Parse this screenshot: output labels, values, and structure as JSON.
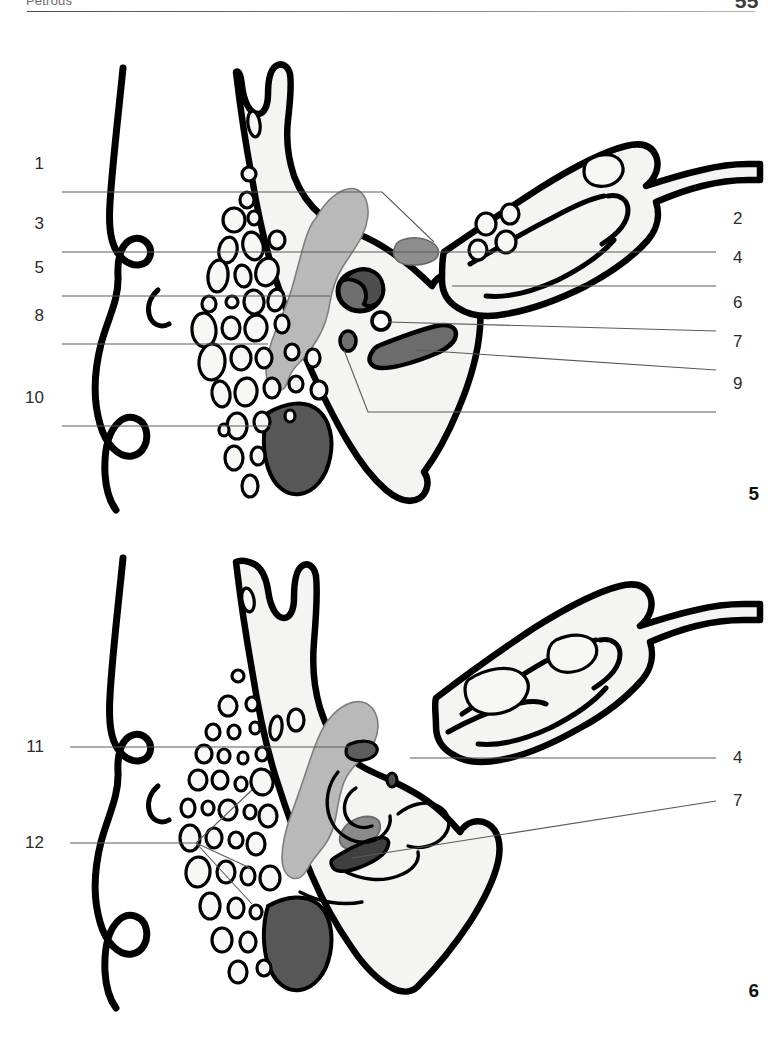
{
  "page": {
    "running_head": "Petrous",
    "folio": "55",
    "width": 781,
    "height": 1050
  },
  "colors": {
    "ink": "#000000",
    "paper": "#ffffff",
    "bone_fill": "#f4f4f2",
    "shade_light": "#b9b9b9",
    "shade_mid": "#8e8e8e",
    "shade_dark": "#585858",
    "leader": "#5a5a5a",
    "label_text": "#2b2b2b"
  },
  "figures": [
    {
      "id": "figure-5",
      "number": "5",
      "callouts_left": [
        {
          "label": "1",
          "x": 44,
          "y": 164
        },
        {
          "label": "3",
          "x": 44,
          "y": 224
        },
        {
          "label": "5",
          "x": 44,
          "y": 268
        },
        {
          "label": "8",
          "x": 44,
          "y": 316
        },
        {
          "label": "10",
          "x": 44,
          "y": 398
        }
      ],
      "callouts_right": [
        {
          "label": "2",
          "x": 733,
          "y": 219
        },
        {
          "label": "4",
          "x": 733,
          "y": 258
        },
        {
          "label": "6",
          "x": 733,
          "y": 303
        },
        {
          "label": "7",
          "x": 733,
          "y": 342
        },
        {
          "label": "9",
          "x": 733,
          "y": 384
        }
      ]
    },
    {
      "id": "figure-6",
      "number": "6",
      "callouts_left": [
        {
          "label": "11",
          "x": 44,
          "y": 747
        },
        {
          "label": "12",
          "x": 44,
          "y": 843
        }
      ],
      "callouts_right": [
        {
          "label": "4",
          "x": 733,
          "y": 758
        },
        {
          "label": "7",
          "x": 733,
          "y": 801
        }
      ]
    }
  ]
}
